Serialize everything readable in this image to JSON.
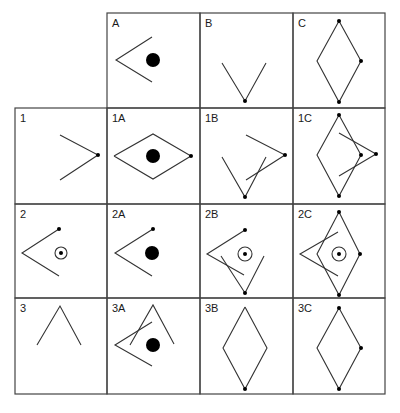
{
  "colors": {
    "line": "#333333",
    "fill": "#000000",
    "background": "#ffffff"
  },
  "grid": {
    "col_lines": [
      15,
      107,
      200,
      293,
      385
    ],
    "row_lines": [
      13,
      108,
      204,
      298,
      394
    ]
  },
  "cells": [
    {
      "id": "A",
      "label": "A",
      "row": 0,
      "col": 1,
      "lines": [
        [
          [
            152,
            37
          ],
          [
            116,
            60
          ],
          [
            152,
            82
          ]
        ]
      ],
      "dots": [],
      "filled_circles": [
        [
          153,
          60,
          7
        ]
      ],
      "rings": []
    },
    {
      "id": "B",
      "label": "B",
      "row": 0,
      "col": 2,
      "lines": [
        [
          [
            222,
            63
          ],
          [
            245,
            101
          ],
          [
            266,
            63
          ]
        ]
      ],
      "dots": [
        [
          245,
          101
        ]
      ],
      "filled_circles": [],
      "rings": []
    },
    {
      "id": "C",
      "label": "C",
      "row": 0,
      "col": 3,
      "lines": [
        [
          [
            339,
            21
          ],
          [
            317,
            61
          ],
          [
            339,
            102
          ],
          [
            361,
            61
          ],
          [
            339,
            21
          ]
        ]
      ],
      "dots": [
        [
          339,
          21
        ],
        [
          361,
          61
        ],
        [
          339,
          102
        ]
      ],
      "filled_circles": [],
      "rings": []
    },
    {
      "id": "1",
      "label": "1",
      "row": 1,
      "col": 0,
      "lines": [
        [
          [
            60,
            135
          ],
          [
            98,
            155
          ],
          [
            60,
            180
          ]
        ]
      ],
      "dots": [
        [
          98,
          155
        ]
      ],
      "filled_circles": [],
      "rings": []
    },
    {
      "id": "1A",
      "label": "1A",
      "row": 1,
      "col": 1,
      "lines": [
        [
          [
            114,
            156
          ],
          [
            153,
            134
          ],
          [
            191,
            156
          ],
          [
            153,
            179
          ],
          [
            114,
            156
          ]
        ]
      ],
      "dots": [
        [
          191,
          156
        ]
      ],
      "filled_circles": [
        [
          153,
          156,
          7
        ]
      ],
      "rings": []
    },
    {
      "id": "1B",
      "label": "1B",
      "row": 1,
      "col": 2,
      "lines": [
        [
          [
            246,
            135
          ],
          [
            285,
            155
          ],
          [
            246,
            180
          ]
        ],
        [
          [
            222,
            157
          ],
          [
            245,
            197
          ],
          [
            266,
            157
          ]
        ]
      ],
      "dots": [
        [
          285,
          155
        ],
        [
          245,
          197
        ]
      ],
      "filled_circles": [],
      "rings": []
    },
    {
      "id": "1C",
      "label": "1C",
      "row": 1,
      "col": 3,
      "lines": [
        [
          [
            339,
            115
          ],
          [
            317,
            155
          ],
          [
            339,
            196
          ],
          [
            361,
            155
          ],
          [
            339,
            115
          ]
        ],
        [
          [
            339,
            133
          ],
          [
            376,
            154
          ],
          [
            339,
            176
          ]
        ]
      ],
      "dots": [
        [
          339,
          115
        ],
        [
          361,
          155
        ],
        [
          376,
          154
        ],
        [
          339,
          196
        ]
      ],
      "filled_circles": [],
      "rings": []
    },
    {
      "id": "2",
      "label": "2",
      "row": 2,
      "col": 0,
      "lines": [
        [
          [
            59,
            229
          ],
          [
            22,
            253
          ],
          [
            59,
            276
          ]
        ]
      ],
      "dots": [
        [
          59,
          229
        ],
        [
          61,
          253
        ]
      ],
      "filled_circles": [],
      "rings": [
        [
          61,
          253,
          6
        ]
      ]
    },
    {
      "id": "2A",
      "label": "2A",
      "row": 2,
      "col": 1,
      "lines": [
        [
          [
            153,
            229
          ],
          [
            115,
            253
          ],
          [
            152,
            276
          ]
        ]
      ],
      "dots": [
        [
          153,
          229
        ]
      ],
      "filled_circles": [
        [
          152,
          253,
          7
        ]
      ],
      "rings": []
    },
    {
      "id": "2B",
      "label": "2B",
      "row": 2,
      "col": 2,
      "lines": [
        [
          [
            245,
            230
          ],
          [
            207,
            254
          ],
          [
            244,
            275
          ]
        ],
        [
          [
            221,
            256
          ],
          [
            245,
            293
          ],
          [
            264,
            256
          ]
        ]
      ],
      "dots": [
        [
          245,
          230
        ],
        [
          245,
          293
        ],
        [
          245,
          254
        ]
      ],
      "filled_circles": [],
      "rings": [
        [
          245,
          254,
          7
        ]
      ]
    },
    {
      "id": "2C",
      "label": "2C",
      "row": 2,
      "col": 3,
      "lines": [
        [
          [
            339,
            212
          ],
          [
            317,
            254
          ],
          [
            339,
            295
          ],
          [
            360,
            254
          ],
          [
            339,
            212
          ]
        ],
        [
          [
            338,
            232
          ],
          [
            300,
            254
          ],
          [
            338,
            276
          ]
        ]
      ],
      "dots": [
        [
          339,
          212
        ],
        [
          360,
          254
        ],
        [
          339,
          295
        ],
        [
          339,
          254
        ]
      ],
      "filled_circles": [],
      "rings": [
        [
          339,
          254,
          7
        ]
      ]
    },
    {
      "id": "3",
      "label": "3",
      "row": 3,
      "col": 0,
      "lines": [
        [
          [
            37,
            345
          ],
          [
            60,
            306
          ],
          [
            81,
            345
          ]
        ]
      ],
      "dots": [],
      "filled_circles": [],
      "rings": []
    },
    {
      "id": "3A",
      "label": "3A",
      "row": 3,
      "col": 1,
      "lines": [
        [
          [
            130,
            345
          ],
          [
            153,
            305
          ],
          [
            174,
            344
          ]
        ],
        [
          [
            152,
            322
          ],
          [
            115,
            345
          ],
          [
            152,
            366
          ]
        ]
      ],
      "dots": [],
      "filled_circles": [
        [
          153,
          345,
          7
        ]
      ],
      "rings": []
    },
    {
      "id": "3B",
      "label": "3B",
      "row": 3,
      "col": 2,
      "lines": [
        [
          [
            245,
            307
          ],
          [
            223,
            348
          ],
          [
            245,
            389
          ],
          [
            267,
            348
          ],
          [
            245,
            307
          ]
        ]
      ],
      "dots": [
        [
          245,
          389
        ]
      ],
      "filled_circles": [],
      "rings": []
    },
    {
      "id": "3C",
      "label": "3C",
      "row": 3,
      "col": 3,
      "lines": [
        [
          [
            339,
            308
          ],
          [
            317,
            348
          ],
          [
            339,
            389
          ],
          [
            361,
            348
          ],
          [
            339,
            308
          ]
        ]
      ],
      "dots": [
        [
          339,
          308
        ],
        [
          361,
          348
        ],
        [
          339,
          389
        ]
      ],
      "filled_circles": [],
      "rings": []
    }
  ]
}
